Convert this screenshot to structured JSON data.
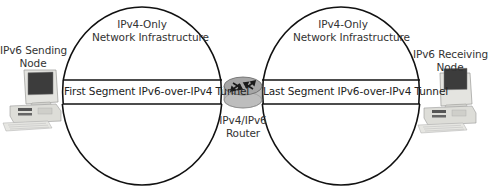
{
  "diagram": {
    "type": "network-tunnel-diagram",
    "networks": [
      {
        "id": "left",
        "label_line1": "IPv4-Only",
        "label_line2": "Network Infrastructure"
      },
      {
        "id": "right",
        "label_line1": "IPv4-Only",
        "label_line2": "Network Infrastructure"
      }
    ],
    "nodes": {
      "sender": {
        "label_line1": "IPv6 Sending",
        "label_line2": "Node",
        "icon": "desktop-computer-icon"
      },
      "router": {
        "label_line1": "IPv4/IPv6",
        "label_line2": "Router",
        "icon": "router-icon"
      },
      "receiver": {
        "label_line1": "IPv6 Receiving",
        "label_line2": "Node",
        "icon": "desktop-computer-icon"
      }
    },
    "tunnels": [
      {
        "id": "first",
        "label": "First Segment IPv6-over-IPv4 Tunnel"
      },
      {
        "id": "last",
        "label": "Last Segment IPv6-over-IPv4 Tunnel"
      }
    ],
    "colors": {
      "line": "#111111",
      "router_body": "#c9c9c9",
      "router_top": "#9a9a9a",
      "computer_body": "#e2e2de",
      "computer_screen": "#3a3a3a"
    }
  }
}
